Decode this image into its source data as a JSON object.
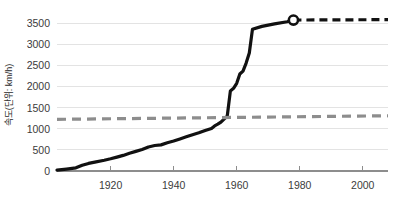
{
  "chart_data": {
    "type": "line",
    "title": "",
    "xlabel": "",
    "ylabel": "속도(단위: km/h)",
    "xlim": [
      1903,
      2008
    ],
    "ylim": [
      0,
      3700
    ],
    "grid": true,
    "legend_position": "none",
    "x_ticks": [
      1920,
      1940,
      1960,
      1980,
      2000
    ],
    "x_tick_labels": [
      "1920",
      "1940",
      "1960",
      "1980",
      "2000"
    ],
    "y_ticks": [
      0,
      500,
      1000,
      1500,
      2000,
      2500,
      3000,
      3500
    ],
    "y_tick_labels": [
      "0",
      "500",
      "1000",
      "1500",
      "2000",
      "2500",
      "3000",
      "3500"
    ],
    "series": [
      {
        "name": "최고 속도 기록",
        "style": "solid",
        "color": "#111111",
        "x": [
          1903,
          1906,
          1909,
          1911,
          1913,
          1915,
          1918,
          1920,
          1922,
          1924,
          1926,
          1928,
          1930,
          1932,
          1934,
          1936,
          1938,
          1940,
          1942,
          1944,
          1946,
          1948,
          1950,
          1952,
          1953,
          1954,
          1955,
          1956,
          1957,
          1958,
          1959,
          1960,
          1961,
          1962,
          1963,
          1964,
          1965,
          1968,
          1972,
          1976,
          1978
        ],
        "y": [
          20,
          45,
          75,
          135,
          180,
          210,
          255,
          290,
          330,
          370,
          420,
          465,
          510,
          570,
          605,
          620,
          670,
          710,
          760,
          810,
          860,
          905,
          960,
          1010,
          1070,
          1110,
          1160,
          1230,
          1300,
          1900,
          1960,
          2080,
          2300,
          2370,
          2560,
          2800,
          3360,
          3430,
          3490,
          3540,
          3580
        ]
      },
      {
        "name": "예상 연장 (점선)",
        "style": "dashed",
        "color": "#111111",
        "x": [
          1978,
          2008
        ],
        "y": [
          3580,
          3590
        ]
      },
      {
        "name": "음속 (마하 1)",
        "style": "dashed",
        "color": "#8d8d8d",
        "x": [
          1903,
          2008
        ],
        "y": [
          1225,
          1310
        ]
      }
    ],
    "markers": [
      {
        "name": "record-endpoint",
        "x": 1978,
        "y": 3580,
        "shape": "open-circle"
      }
    ]
  }
}
